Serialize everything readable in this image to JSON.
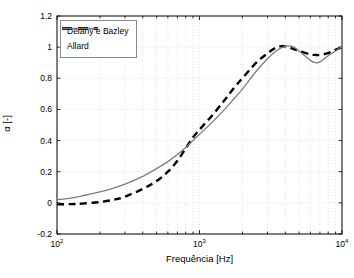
{
  "figure": {
    "background": "#ffffff",
    "axes_color": "#000000",
    "grid_color": "#d6d6d6",
    "tick_label_color": "#000000"
  },
  "chart_data": {
    "type": "line",
    "title": "",
    "xlabel": "Frequência [Hz]",
    "ylabel": "α [-]",
    "x_scale": "log",
    "xlim": [
      100,
      10000
    ],
    "ylim": [
      -0.2,
      1.2
    ],
    "grid": true,
    "legend_position": "top-left",
    "x_ticks_major": [
      {
        "value": 100,
        "base": "10",
        "exp": "2"
      },
      {
        "value": 1000,
        "base": "10",
        "exp": "3"
      },
      {
        "value": 10000,
        "base": "10",
        "exp": "4"
      }
    ],
    "x_ticks_minor": [
      200,
      300,
      400,
      500,
      600,
      700,
      800,
      900,
      2000,
      3000,
      4000,
      5000,
      6000,
      7000,
      8000,
      9000
    ],
    "y_ticks": [
      {
        "value": 1.2,
        "label": "1.2"
      },
      {
        "value": 1,
        "label": "1"
      },
      {
        "value": 0.8,
        "label": "0.8"
      },
      {
        "value": 0.6,
        "label": "0.6"
      },
      {
        "value": 0.4,
        "label": "0.4"
      },
      {
        "value": 0.2,
        "label": "0.2"
      },
      {
        "value": 0,
        "label": "0"
      },
      {
        "value": -0.2,
        "label": "-0.2"
      }
    ],
    "x_shared": [
      100,
      125,
      150,
      200,
      250,
      300,
      400,
      500,
      600,
      700,
      800,
      900,
      1000,
      1250,
      1500,
      1750,
      2000,
      2500,
      3000,
      3500,
      4000,
      4500,
      5000,
      6000,
      6500,
      7000,
      8000,
      9000,
      10000
    ],
    "series": [
      {
        "name": "Delany e Bazley",
        "color": "#000000",
        "style": "dashed",
        "width": 2.4,
        "values": [
          -0.01,
          -0.008,
          -0.005,
          0.005,
          0.02,
          0.04,
          0.09,
          0.14,
          0.2,
          0.27,
          0.35,
          0.42,
          0.47,
          0.57,
          0.66,
          0.74,
          0.8,
          0.9,
          0.96,
          1.0,
          1.005,
          0.99,
          0.975,
          0.953,
          0.95,
          0.95,
          0.962,
          0.983,
          1.0
        ]
      },
      {
        "name": "Allard",
        "color": "#7d7d7d",
        "style": "solid",
        "width": 1.3,
        "values": [
          0.02,
          0.03,
          0.045,
          0.07,
          0.095,
          0.12,
          0.17,
          0.22,
          0.265,
          0.31,
          0.355,
          0.4,
          0.44,
          0.525,
          0.6,
          0.67,
          0.73,
          0.845,
          0.925,
          0.98,
          1.005,
          1.005,
          0.975,
          0.915,
          0.9,
          0.905,
          0.945,
          0.975,
          1.005
        ]
      }
    ]
  }
}
